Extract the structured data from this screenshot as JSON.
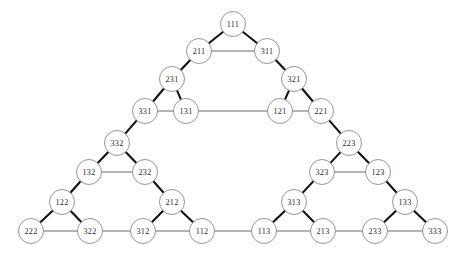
{
  "figure": {
    "title": "",
    "type": "graph"
  },
  "chart_data": {
    "type": "graph",
    "title": "",
    "xlabel": "",
    "ylabel": "",
    "grid": false,
    "legend": null,
    "node_radius": 12.5,
    "colors": {
      "background": "#ffffff",
      "node_fill": "#ffffff",
      "node_stroke": "#8a8a8a",
      "label": "#2b2b2b",
      "edge_diagonal": "#121212",
      "edge_horizontal": "#6b6b6b"
    },
    "nodes": [
      {
        "id": "111",
        "label": "111",
        "x": 233,
        "y": 24
      },
      {
        "id": "211",
        "label": "211",
        "x": 199,
        "y": 51
      },
      {
        "id": "311",
        "label": "311",
        "x": 267,
        "y": 51
      },
      {
        "id": "231",
        "label": "231",
        "x": 172,
        "y": 79
      },
      {
        "id": "331",
        "label": "331",
        "x": 145,
        "y": 111
      },
      {
        "id": "131",
        "label": "131",
        "x": 186,
        "y": 111
      },
      {
        "id": "321",
        "label": "321",
        "x": 294,
        "y": 79
      },
      {
        "id": "121",
        "label": "121",
        "x": 280,
        "y": 111
      },
      {
        "id": "221",
        "label": "221",
        "x": 321,
        "y": 111
      },
      {
        "id": "332",
        "label": "332",
        "x": 117,
        "y": 143
      },
      {
        "id": "132",
        "label": "132",
        "x": 89,
        "y": 172
      },
      {
        "id": "232",
        "label": "232",
        "x": 145,
        "y": 172
      },
      {
        "id": "122",
        "label": "122",
        "x": 62,
        "y": 202
      },
      {
        "id": "222",
        "label": "222",
        "x": 31,
        "y": 231
      },
      {
        "id": "322",
        "label": "322",
        "x": 90,
        "y": 231
      },
      {
        "id": "212",
        "label": "212",
        "x": 172,
        "y": 202
      },
      {
        "id": "312",
        "label": "312",
        "x": 143,
        "y": 231
      },
      {
        "id": "112",
        "label": "112",
        "x": 202,
        "y": 231
      },
      {
        "id": "223",
        "label": "223",
        "x": 349,
        "y": 143
      },
      {
        "id": "323",
        "label": "323",
        "x": 322,
        "y": 172
      },
      {
        "id": "123",
        "label": "123",
        "x": 378,
        "y": 172
      },
      {
        "id": "313",
        "label": "313",
        "x": 294,
        "y": 202
      },
      {
        "id": "113",
        "label": "113",
        "x": 264,
        "y": 231
      },
      {
        "id": "213",
        "label": "213",
        "x": 323,
        "y": 231
      },
      {
        "id": "133",
        "label": "133",
        "x": 405,
        "y": 202
      },
      {
        "id": "233",
        "label": "233",
        "x": 375,
        "y": 231
      },
      {
        "id": "333",
        "label": "333",
        "x": 435,
        "y": 231
      }
    ],
    "edges": [
      {
        "from": "111",
        "to": "211",
        "style": "diagonal"
      },
      {
        "from": "111",
        "to": "311",
        "style": "diagonal"
      },
      {
        "from": "211",
        "to": "311",
        "style": "horizontal"
      },
      {
        "from": "211",
        "to": "231",
        "style": "diagonal"
      },
      {
        "from": "231",
        "to": "331",
        "style": "diagonal"
      },
      {
        "from": "231",
        "to": "131",
        "style": "diagonal"
      },
      {
        "from": "331",
        "to": "131",
        "style": "horizontal"
      },
      {
        "from": "311",
        "to": "321",
        "style": "diagonal"
      },
      {
        "from": "321",
        "to": "121",
        "style": "diagonal"
      },
      {
        "from": "321",
        "to": "221",
        "style": "diagonal"
      },
      {
        "from": "121",
        "to": "221",
        "style": "horizontal"
      },
      {
        "from": "131",
        "to": "121",
        "style": "horizontal"
      },
      {
        "from": "331",
        "to": "332",
        "style": "diagonal"
      },
      {
        "from": "332",
        "to": "132",
        "style": "diagonal"
      },
      {
        "from": "332",
        "to": "232",
        "style": "diagonal"
      },
      {
        "from": "132",
        "to": "232",
        "style": "horizontal"
      },
      {
        "from": "132",
        "to": "122",
        "style": "diagonal"
      },
      {
        "from": "122",
        "to": "222",
        "style": "diagonal"
      },
      {
        "from": "122",
        "to": "322",
        "style": "diagonal"
      },
      {
        "from": "222",
        "to": "322",
        "style": "horizontal"
      },
      {
        "from": "232",
        "to": "212",
        "style": "diagonal"
      },
      {
        "from": "212",
        "to": "312",
        "style": "diagonal"
      },
      {
        "from": "212",
        "to": "112",
        "style": "diagonal"
      },
      {
        "from": "312",
        "to": "112",
        "style": "horizontal"
      },
      {
        "from": "322",
        "to": "312",
        "style": "horizontal"
      },
      {
        "from": "221",
        "to": "223",
        "style": "diagonal"
      },
      {
        "from": "223",
        "to": "323",
        "style": "diagonal"
      },
      {
        "from": "223",
        "to": "123",
        "style": "diagonal"
      },
      {
        "from": "323",
        "to": "123",
        "style": "horizontal"
      },
      {
        "from": "323",
        "to": "313",
        "style": "diagonal"
      },
      {
        "from": "313",
        "to": "113",
        "style": "diagonal"
      },
      {
        "from": "313",
        "to": "213",
        "style": "diagonal"
      },
      {
        "from": "113",
        "to": "213",
        "style": "horizontal"
      },
      {
        "from": "123",
        "to": "133",
        "style": "diagonal"
      },
      {
        "from": "133",
        "to": "233",
        "style": "diagonal"
      },
      {
        "from": "133",
        "to": "333",
        "style": "diagonal"
      },
      {
        "from": "233",
        "to": "333",
        "style": "horizontal"
      },
      {
        "from": "213",
        "to": "233",
        "style": "horizontal"
      },
      {
        "from": "112",
        "to": "113",
        "style": "horizontal"
      }
    ]
  }
}
